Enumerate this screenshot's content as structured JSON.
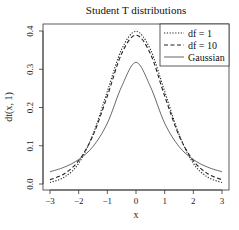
{
  "chart_data": {
    "type": "line",
    "title": "Student T distributions",
    "xlabel": "x",
    "ylabel": "dt(x, 1)",
    "xlim": [
      -3,
      3
    ],
    "ylim": [
      0.0,
      0.4
    ],
    "x_ticks": [
      "-3",
      "-2",
      "-1",
      "0",
      "1",
      "2",
      "3"
    ],
    "y_ticks": [
      "0.0",
      "0.1",
      "0.2",
      "0.3",
      "0.4"
    ],
    "grid": false,
    "legend_position": "top-right",
    "x": [
      -3,
      -2.5,
      -2,
      -1.5,
      -1,
      -0.5,
      0,
      0.5,
      1,
      1.5,
      2,
      2.5,
      3
    ],
    "series": [
      {
        "name": "df = 1",
        "linestyle": "dotted",
        "color": "#222222",
        "values": [
          0.004,
          0.018,
          0.054,
          0.13,
          0.242,
          0.352,
          0.399,
          0.352,
          0.242,
          0.13,
          0.054,
          0.018,
          0.004
        ]
      },
      {
        "name": "df = 10",
        "linestyle": "dashed",
        "color": "#222222",
        "values": [
          0.011,
          0.027,
          0.061,
          0.127,
          0.23,
          0.341,
          0.389,
          0.341,
          0.23,
          0.127,
          0.061,
          0.027,
          0.011
        ]
      },
      {
        "name": "Gaussian",
        "linestyle": "solid",
        "color": "#555555",
        "values": [
          0.032,
          0.044,
          0.064,
          0.098,
          0.159,
          0.255,
          0.318,
          0.255,
          0.159,
          0.098,
          0.064,
          0.044,
          0.032
        ]
      }
    ]
  }
}
